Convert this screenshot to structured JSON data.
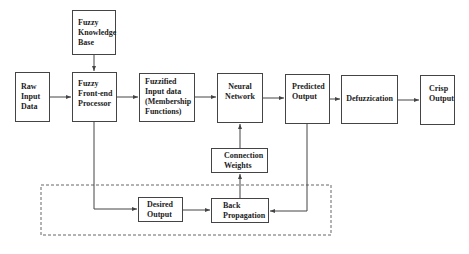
{
  "diagram": {
    "nodes": {
      "raw_input": "Raw\nInput\nData",
      "knowledge_base": "Fuzzy\nKnowledge\nBase",
      "front_end": "Fuzzy\nFront-end\nProcessor",
      "fuzzified": "Fuzzified\nInput data\n(Membership\nFunctions)",
      "neural_network": "Neural\nNetwork",
      "predicted_output": "Predicted\nOutput",
      "defuzzication": "Defuzzication",
      "crisp_output": "Crisp\nOutput",
      "connection_weights": "Connection\nWeights",
      "desired_output": "Desired\nOutput",
      "back_propagation": "Back\nPropagation"
    },
    "edges": [
      {
        "from": "knowledge_base",
        "to": "front_end"
      },
      {
        "from": "raw_input",
        "to": "front_end"
      },
      {
        "from": "front_end",
        "to": "fuzzified"
      },
      {
        "from": "fuzzified",
        "to": "neural_network"
      },
      {
        "from": "neural_network",
        "to": "predicted_output"
      },
      {
        "from": "predicted_output",
        "to": "defuzzication"
      },
      {
        "from": "defuzzication",
        "to": "crisp_output"
      },
      {
        "from": "front_end",
        "to": "desired_output"
      },
      {
        "from": "desired_output",
        "to": "back_propagation"
      },
      {
        "from": "predicted_output",
        "to": "back_propagation"
      },
      {
        "from": "back_propagation",
        "to": "connection_weights"
      },
      {
        "from": "connection_weights",
        "to": "neural_network"
      }
    ],
    "groups": [
      {
        "name": "training-loop",
        "style": "dashed",
        "members": [
          "desired_output",
          "back_propagation"
        ]
      }
    ]
  }
}
